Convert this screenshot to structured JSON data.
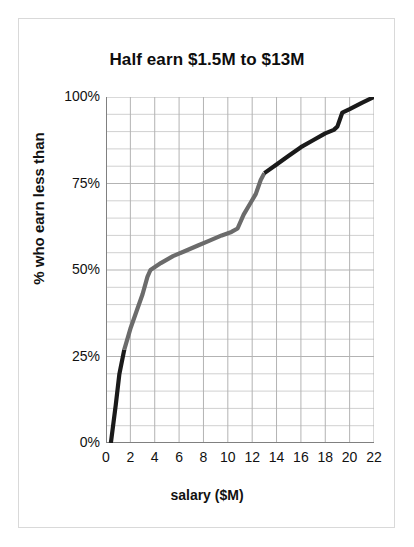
{
  "chart_data": {
    "type": "line",
    "title": "Half earn $1.5M to $13M",
    "xlabel": "salary ($M)",
    "ylabel": "% who earn less than",
    "xlim": [
      0,
      22
    ],
    "ylim": [
      0,
      100
    ],
    "grid": true,
    "legend": "none",
    "xticks": [
      0,
      2,
      4,
      6,
      8,
      10,
      12,
      14,
      16,
      18,
      20,
      22
    ],
    "xtick_labels": [
      "0",
      "2",
      "4",
      "6",
      "8",
      "10",
      "12",
      "14",
      "16",
      "18",
      "20",
      "22"
    ],
    "yticks": [
      0,
      25,
      50,
      75,
      100
    ],
    "ytick_labels": [
      "0%",
      "25%",
      "50%",
      "75%",
      "100%"
    ],
    "x_minor_step": 2,
    "y_minor_step": 5,
    "series": [
      {
        "name": "cumulative share of players earning less than salary",
        "x": [
          0.4,
          0.8,
          1.1,
          1.5,
          2.0,
          2.5,
          3.0,
          3.4,
          3.65,
          4.5,
          5.5,
          6.5,
          7.5,
          8.5,
          9.5,
          10.3,
          10.8,
          11.3,
          11.8,
          12.3,
          12.7,
          13.0,
          14.0,
          15.0,
          16.0,
          17.0,
          18.0,
          18.7,
          19.0,
          19.4,
          20.0,
          21.0,
          22.0
        ],
        "y": [
          0,
          11,
          20,
          27,
          33,
          38,
          43,
          48,
          50,
          52,
          54,
          55.5,
          57,
          58.5,
          60,
          61,
          62,
          66,
          69,
          72,
          76,
          78,
          80.5,
          83,
          85.5,
          87.5,
          89.5,
          90.5,
          91.5,
          95.5,
          96.5,
          98.3,
          100
        ]
      }
    ],
    "annotations": [
      {
        "label": "median range lower bound",
        "x": 1.5,
        "y": 27
      },
      {
        "label": "median range upper bound",
        "x": 13.0,
        "y": 78
      }
    ]
  },
  "style": {
    "line_color_dark": "#1a1a1a",
    "line_color_mid": "#6b6b6b",
    "grid_color": "#b3b3b3",
    "grid_minor_color": "#d0d0d0",
    "axis_color": "#808080",
    "frame_color": "#d9d9d9",
    "background": "#ffffff",
    "text_color": "#111111"
  },
  "segments": [
    {
      "name": "lower-tail-dark",
      "from_x": 0.4,
      "to_x": 1.5,
      "color_key": "line_color_dark"
    },
    {
      "name": "middle-half-gray",
      "from_x": 1.5,
      "to_x": 13.0,
      "color_key": "line_color_mid"
    },
    {
      "name": "upper-tail-dark",
      "from_x": 13.0,
      "to_x": 22.0,
      "color_key": "line_color_dark"
    }
  ]
}
